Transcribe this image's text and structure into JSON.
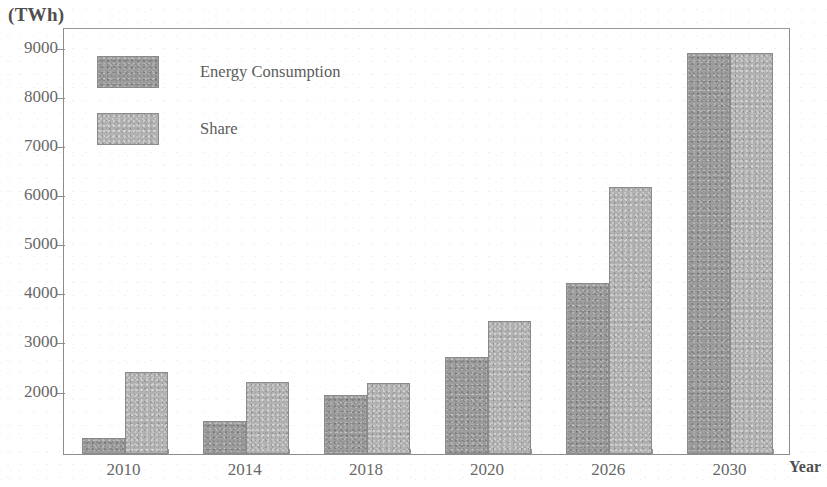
{
  "chart_data": {
    "type": "bar",
    "title": "",
    "subtitle": "",
    "xlabel": "Year",
    "ylabel": "(TWh)",
    "categories": [
      "2010",
      "2014",
      "2018",
      "2020",
      "2026",
      "2030"
    ],
    "series": [
      {
        "name": "Energy Consumption",
        "color": "#9d9d9d",
        "values": [
          1030,
          1380,
          1900,
          2680,
          4180,
          8870
        ]
      },
      {
        "name": "Share",
        "color": "#b2b2b2",
        "values": [
          2380,
          2170,
          2150,
          3420,
          6150,
          8870
        ]
      }
    ],
    "ylim": [
      708,
      9400
    ],
    "yticks": [
      2000,
      3000,
      4000,
      5000,
      6000,
      7000,
      8000,
      9000
    ],
    "ytick_labels": [
      "2000",
      "3000",
      "4000",
      "5000",
      "6000",
      "7000",
      "8000",
      "9000"
    ],
    "grid": false,
    "legend_position": "top-left",
    "axis_color": "#8c8c8c"
  },
  "axis": {
    "y_unit_label": "(TWh)",
    "x_caption": "Year"
  },
  "legend": {
    "entries": [
      {
        "label": "Energy Consumption",
        "swatch": "series-0"
      },
      {
        "label": "Share",
        "swatch": "series-1"
      }
    ]
  }
}
